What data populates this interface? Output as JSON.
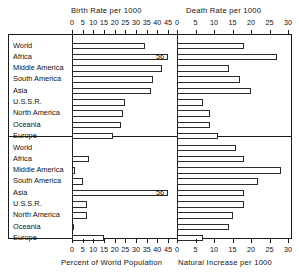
{
  "titles": {
    "top_left": "Birth Rate per 1000",
    "top_right": "Death Rate per 1000",
    "bottom_left": "Percent of World Population",
    "bottom_right": "Natural Increase per 1000"
  },
  "regions": [
    "World",
    "Africa",
    "Middle America",
    "South America",
    "Asia",
    "U.S.S.R.",
    "North America",
    "Oceania",
    "Europe"
  ],
  "axes": {
    "left_ticks": [
      "0",
      "5",
      "10",
      "15",
      "20",
      "25",
      "30",
      "35",
      "40",
      "45"
    ],
    "right_ticks": [
      "0",
      "5",
      "10",
      "15",
      "20",
      "25",
      "30"
    ],
    "left_max": 45,
    "right_max": 30
  },
  "annotations": {
    "asia_population": "56"
  },
  "chart_data": [
    {
      "type": "bar",
      "title": "Birth Rate per 1000",
      "orientation": "horizontal",
      "panel": "top-left",
      "xlabel": "Birth Rate per 1000",
      "ylabel": "",
      "xlim": [
        0,
        45
      ],
      "grid": false,
      "legend": "none",
      "categories": [
        "World",
        "Africa",
        "Middle America",
        "South America",
        "Asia",
        "U.S.S.R.",
        "North America",
        "Oceania",
        "Europe"
      ],
      "values": [
        34,
        47,
        42,
        38,
        37,
        25,
        24,
        23,
        19
      ],
      "tick_labels": [
        "0",
        "5",
        "10",
        "15",
        "20",
        "25",
        "30",
        "35",
        "40",
        "45"
      ]
    },
    {
      "type": "bar",
      "title": "Death Rate per 1000",
      "orientation": "horizontal",
      "panel": "top-right",
      "xlabel": "Death Rate per 1000",
      "ylabel": "",
      "xlim": [
        0,
        30
      ],
      "grid": false,
      "legend": "none",
      "categories": [
        "World",
        "Africa",
        "Middle America",
        "South America",
        "Asia",
        "U.S.S.R.",
        "North America",
        "Oceania",
        "Europe"
      ],
      "values": [
        18,
        27,
        14,
        17,
        20,
        7,
        9,
        9,
        11
      ],
      "tick_labels": [
        "0",
        "5",
        "10",
        "15",
        "20",
        "25",
        "30"
      ]
    },
    {
      "type": "bar",
      "title": "Percent of World Population",
      "orientation": "horizontal",
      "panel": "bottom-left",
      "xlabel": "Percent of World Population",
      "ylabel": "",
      "xlim": [
        0,
        45
      ],
      "grid": false,
      "legend": "none",
      "categories": [
        "World",
        "Africa",
        "Middle America",
        "South America",
        "Asia",
        "U.S.S.R.",
        "North America",
        "Oceania",
        "Europe"
      ],
      "values": [
        null,
        8,
        1.5,
        5,
        56,
        7,
        7,
        0.5,
        15
      ],
      "annotations": [
        {
          "category": "Asia",
          "label": "56",
          "note": "bar exceeds axis maximum"
        }
      ],
      "tick_labels": [
        "0",
        "5",
        "10",
        "15",
        "20",
        "25",
        "30",
        "35",
        "40",
        "45"
      ]
    },
    {
      "type": "bar",
      "title": "Natural Increase per 1000",
      "orientation": "horizontal",
      "panel": "bottom-right",
      "xlabel": "Natural Increase per 1000",
      "ylabel": "",
      "xlim": [
        0,
        30
      ],
      "grid": false,
      "legend": "none",
      "categories": [
        "World",
        "Africa",
        "Middle America",
        "South America",
        "Asia",
        "U.S.S.R.",
        "North America",
        "Oceania",
        "Europe"
      ],
      "values": [
        16,
        18,
        28,
        22,
        18,
        18,
        15,
        14,
        7
      ],
      "tick_labels": [
        "0",
        "5",
        "10",
        "15",
        "20",
        "25",
        "30"
      ]
    }
  ]
}
